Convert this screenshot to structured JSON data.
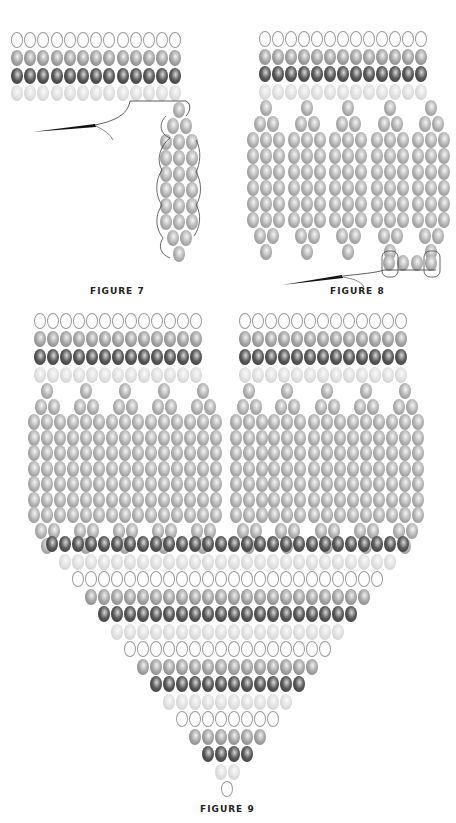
{
  "figures": [
    {
      "id": "figure-7",
      "caption": "FIGURE 7",
      "caption_pos": [
        90,
        292
      ],
      "band": {
        "x0": 17,
        "pitch": 13.2,
        "count": 13,
        "rows": [
          {
            "y": 40,
            "color": "white"
          },
          {
            "y": 58,
            "color": "mid"
          },
          {
            "y": 76,
            "color": "dark"
          },
          {
            "y": 93,
            "color": "light"
          }
        ]
      },
      "fringes": [
        {
          "cx": 179,
          "y0": 110,
          "rows": [
            1,
            2,
            3,
            3,
            3,
            3,
            3,
            3,
            2,
            1
          ],
          "pitch_y": 16
        }
      ]
    },
    {
      "id": "figure-8",
      "caption": "FIGURE 8",
      "caption_pos": [
        330,
        292
      ],
      "band": {
        "x0": 265,
        "pitch": 13,
        "count": 13,
        "rows": [
          {
            "y": 39,
            "color": "white"
          },
          {
            "y": 57,
            "color": "mid"
          },
          {
            "y": 74,
            "color": "dark"
          },
          {
            "y": 92,
            "color": "light"
          }
        ]
      },
      "fringes": [
        {
          "cx": 266,
          "y0": 108,
          "rows": [
            1,
            2,
            3,
            3,
            3,
            3,
            3,
            3,
            2,
            1
          ],
          "pitch_y": 16
        },
        {
          "cx": 307,
          "y0": 108,
          "rows": [
            1,
            2,
            3,
            3,
            3,
            3,
            3,
            3,
            2,
            1
          ],
          "pitch_y": 16
        },
        {
          "cx": 348,
          "y0": 108,
          "rows": [
            1,
            2,
            3,
            3,
            3,
            3,
            3,
            3,
            2,
            1
          ],
          "pitch_y": 16
        },
        {
          "cx": 390,
          "y0": 108,
          "rows": [
            1,
            2,
            3,
            3,
            3,
            3,
            3,
            3,
            2,
            1
          ],
          "pitch_y": 16
        },
        {
          "cx": 431,
          "y0": 108,
          "rows": [
            1,
            2,
            3,
            3,
            3,
            3,
            3,
            3,
            2,
            1
          ],
          "pitch_y": 16
        }
      ],
      "connector": {
        "y": 263,
        "xs": [
          389,
          403,
          417,
          431
        ]
      }
    },
    {
      "id": "figure-9",
      "caption": "FIGURE 9",
      "caption_pos": [
        200,
        810
      ],
      "bands": [
        {
          "x0": 40,
          "pitch": 13,
          "count": 13,
          "rows": [
            {
              "y": 321,
              "color": "white"
            },
            {
              "y": 339,
              "color": "mid"
            },
            {
              "y": 357,
              "color": "dark"
            },
            {
              "y": 375,
              "color": "light"
            }
          ]
        },
        {
          "x0": 245,
          "pitch": 13,
          "count": 13,
          "rows": [
            {
              "y": 321,
              "color": "white"
            },
            {
              "y": 339,
              "color": "mid"
            },
            {
              "y": 357,
              "color": "dark"
            },
            {
              "y": 375,
              "color": "light"
            }
          ]
        }
      ],
      "fringes": [
        {
          "cx": 47,
          "y0": 391,
          "rows": [
            1,
            2,
            3,
            3,
            3,
            3,
            3,
            3,
            3,
            2,
            1
          ],
          "pitch_y": 15.5
        },
        {
          "cx": 86,
          "y0": 391,
          "rows": [
            1,
            2,
            3,
            3,
            3,
            3,
            3,
            3,
            3,
            2,
            1
          ],
          "pitch_y": 15.5
        },
        {
          "cx": 125,
          "y0": 391,
          "rows": [
            1,
            2,
            3,
            3,
            3,
            3,
            3,
            3,
            3,
            2,
            1
          ],
          "pitch_y": 15.5
        },
        {
          "cx": 164,
          "y0": 391,
          "rows": [
            1,
            2,
            3,
            3,
            3,
            3,
            3,
            3,
            3,
            2,
            1
          ],
          "pitch_y": 15.5
        },
        {
          "cx": 203,
          "y0": 391,
          "rows": [
            1,
            2,
            3,
            3,
            3,
            3,
            3,
            3,
            3,
            2,
            1
          ],
          "pitch_y": 15.5
        },
        {
          "cx": 249,
          "y0": 391,
          "rows": [
            1,
            2,
            3,
            3,
            3,
            3,
            3,
            3,
            3,
            2,
            1
          ],
          "pitch_y": 15.5
        },
        {
          "cx": 287,
          "y0": 391,
          "rows": [
            1,
            2,
            3,
            3,
            3,
            3,
            3,
            3,
            3,
            2,
            1
          ],
          "pitch_y": 15.5
        },
        {
          "cx": 327,
          "y0": 391,
          "rows": [
            1,
            2,
            3,
            3,
            3,
            3,
            3,
            3,
            3,
            2,
            1
          ],
          "pitch_y": 15.5
        },
        {
          "cx": 366,
          "y0": 391,
          "rows": [
            1,
            2,
            3,
            3,
            3,
            3,
            3,
            3,
            3,
            2,
            1
          ],
          "pitch_y": 15.5
        },
        {
          "cx": 405,
          "y0": 391,
          "rows": [
            1,
            2,
            3,
            3,
            3,
            3,
            3,
            3,
            3,
            2,
            1
          ],
          "pitch_y": 15.5
        }
      ],
      "v_shape": {
        "cx": 227,
        "y0": 544,
        "pitch_x": 13,
        "pitch_y": 17.5,
        "rows": [
          {
            "count": 28,
            "color": "dark"
          },
          {
            "count": 26,
            "color": "light"
          },
          {
            "count": 24,
            "color": "white"
          },
          {
            "count": 22,
            "color": "mid"
          },
          {
            "count": 20,
            "color": "dark"
          },
          {
            "count": 18,
            "color": "light"
          },
          {
            "count": 16,
            "color": "white"
          },
          {
            "count": 14,
            "color": "mid"
          },
          {
            "count": 12,
            "color": "dark"
          },
          {
            "count": 10,
            "color": "light"
          },
          {
            "count": 8,
            "color": "white"
          },
          {
            "count": 6,
            "color": "mid"
          },
          {
            "count": 4,
            "color": "dark"
          },
          {
            "count": 2,
            "color": "light"
          },
          {
            "count": 1,
            "color": "white"
          }
        ]
      }
    }
  ],
  "bead_colors": {
    "white": "#ffffff",
    "light": "#d8d8d8",
    "mid": "#a0a0a0",
    "dark": "#4a4a4a"
  }
}
